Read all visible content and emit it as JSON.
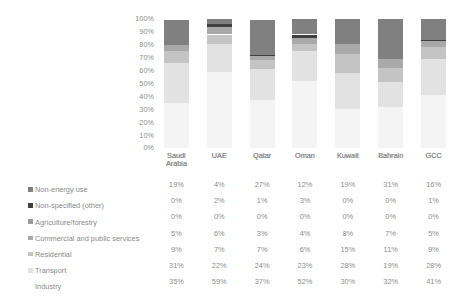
{
  "chart_data": {
    "type": "bar",
    "subtype": "stacked-100-percent-column",
    "title": "",
    "xlabel": "",
    "ylabel": "",
    "ylim": [
      0,
      100
    ],
    "grid": false,
    "legend_position": "left-of-table",
    "categories": [
      "Saudi Arabia",
      "UAE",
      "Qatar",
      "Oman",
      "Kuwait",
      "Bahrain",
      "GCC"
    ],
    "ticklabels": [
      "100%",
      "90%",
      "80%",
      "70%",
      "60%",
      "50%",
      "40%",
      "30%",
      "20%",
      "10%",
      "0%"
    ],
    "stack_order_bottom_to_top": [
      "Industry",
      "Transport",
      "Residential",
      "Commercial and public services",
      "Agriculture/forestry",
      "Non-specified (other)",
      "Non-energy use"
    ],
    "series": [
      {
        "name": "Non-energy use",
        "color": "#808080",
        "has_marker": true,
        "values": [
          19,
          4,
          27,
          12,
          19,
          31,
          16
        ],
        "labels": [
          "19%",
          "4%",
          "27%",
          "12%",
          "19%",
          "31%",
          "16%"
        ]
      },
      {
        "name": "Non-specified (other)",
        "color": "#3f3f3f",
        "has_marker": true,
        "values": [
          0,
          2,
          1,
          3,
          0,
          0,
          1
        ],
        "labels": [
          "0%",
          "2%",
          "1%",
          "3%",
          "0%",
          "0%",
          "1%"
        ]
      },
      {
        "name": "Agriculture/forestry",
        "color": "#9a9a9a",
        "has_marker": true,
        "values": [
          0,
          0,
          0,
          0,
          0,
          0,
          0
        ],
        "labels": [
          "0%",
          "0%",
          "0%",
          "0%",
          "0%",
          "0%",
          "0%"
        ]
      },
      {
        "name": "Commercial and public services",
        "color": "#a9a9a9",
        "has_marker": true,
        "values": [
          5,
          6,
          3,
          4,
          8,
          7,
          5
        ],
        "labels": [
          "5%",
          "6%",
          "3%",
          "4%",
          "8%",
          "7%",
          "5%"
        ]
      },
      {
        "name": "Residential",
        "color": "#c4c4c4",
        "has_marker": true,
        "values": [
          9,
          7,
          7,
          6,
          15,
          11,
          9
        ],
        "labels": [
          "9%",
          "7%",
          "7%",
          "6%",
          "15%",
          "11%",
          "9%"
        ]
      },
      {
        "name": "Transport",
        "color": "#e2e2e2",
        "has_marker": true,
        "values": [
          31,
          22,
          24,
          23,
          28,
          19,
          28
        ],
        "labels": [
          "31%",
          "22%",
          "24%",
          "23%",
          "28%",
          "19%",
          "28%"
        ]
      },
      {
        "name": "Industry",
        "color": "#f4f4f4",
        "has_marker": false,
        "values": [
          35,
          59,
          37,
          52,
          30,
          32,
          41
        ],
        "labels": [
          "35%",
          "59%",
          "37%",
          "52%",
          "30%",
          "32%",
          "41%"
        ]
      }
    ]
  },
  "table": {
    "column_headers": [
      "Saudi Arabia",
      "UAE",
      "Qatar",
      "Oman",
      "Kuwait",
      "Bahrain",
      "GCC"
    ],
    "rows": [
      {
        "label": "Non-energy use",
        "cells": [
          "19%",
          "4%",
          "27%",
          "12%",
          "19%",
          "31%",
          "16%"
        ]
      },
      {
        "label": "Non-specified (other)",
        "cells": [
          "0%",
          "2%",
          "1%",
          "3%",
          "0%",
          "0%",
          "1%"
        ]
      },
      {
        "label": "Agriculture/forestry",
        "cells": [
          "0%",
          "0%",
          "0%",
          "0%",
          "0%",
          "0%",
          "0%"
        ]
      },
      {
        "label": "Commercial and public services",
        "cells": [
          "5%",
          "6%",
          "3%",
          "4%",
          "8%",
          "7%",
          "5%"
        ]
      },
      {
        "label": "Residential",
        "cells": [
          "9%",
          "7%",
          "7%",
          "6%",
          "15%",
          "11%",
          "9%"
        ]
      },
      {
        "label": "Transport",
        "cells": [
          "31%",
          "22%",
          "24%",
          "23%",
          "28%",
          "19%",
          "28%"
        ]
      },
      {
        "label": "Industry",
        "cells": [
          "35%",
          "59%",
          "37%",
          "52%",
          "30%",
          "32%",
          "41%"
        ]
      }
    ]
  }
}
